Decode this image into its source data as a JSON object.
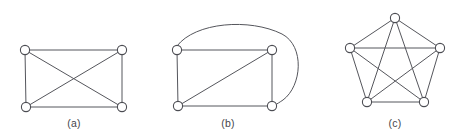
{
  "figure": {
    "background_color": "#ffffff",
    "edge_color": "#55565c",
    "node_fill_color": "#ffffff",
    "node_stroke_color": "#4c4d53",
    "caption_color": "#45464b",
    "node_radius": 4.6,
    "panels": [
      {
        "id": "panel-a",
        "caption": "(a)",
        "caption_position": {
          "x": 74,
          "y": 127
        },
        "graph_type": "K4 with one crossing",
        "vertex_count": 4,
        "edge_count": 6,
        "nodes": [
          {
            "id": "a1",
            "label": "top-left",
            "x": 25,
            "y": 50
          },
          {
            "id": "a2",
            "label": "top-right",
            "x": 122,
            "y": 50
          },
          {
            "id": "a3",
            "label": "bottom-left",
            "x": 26,
            "y": 107
          },
          {
            "id": "a4",
            "label": "bottom-right",
            "x": 122,
            "y": 107
          }
        ],
        "edges": [
          {
            "from": "a1",
            "to": "a2",
            "curved": false
          },
          {
            "from": "a1",
            "to": "a3",
            "curved": false
          },
          {
            "from": "a2",
            "to": "a4",
            "curved": false
          },
          {
            "from": "a3",
            "to": "a4",
            "curved": false
          },
          {
            "from": "a1",
            "to": "a4",
            "curved": false
          },
          {
            "from": "a2",
            "to": "a3",
            "curved": false
          }
        ]
      },
      {
        "id": "panel-b",
        "caption": "(b)",
        "caption_position": {
          "x": 228,
          "y": 127
        },
        "graph_type": "K4 drawn planar (one curved edge)",
        "vertex_count": 4,
        "edge_count": 6,
        "nodes": [
          {
            "id": "b1",
            "label": "top-left",
            "x": 177,
            "y": 50
          },
          {
            "id": "b2",
            "label": "top-right",
            "x": 272,
            "y": 50
          },
          {
            "id": "b3",
            "label": "bottom-left",
            "x": 178,
            "y": 106
          },
          {
            "id": "b4",
            "label": "bottom-right",
            "x": 272,
            "y": 106
          }
        ],
        "edges": [
          {
            "from": "b1",
            "to": "b2",
            "curved": false
          },
          {
            "from": "b1",
            "to": "b3",
            "curved": false
          },
          {
            "from": "b2",
            "to": "b4",
            "curved": false
          },
          {
            "from": "b3",
            "to": "b4",
            "curved": false
          },
          {
            "from": "b3",
            "to": "b2",
            "curved": false
          },
          {
            "from": "b1",
            "to": "b4",
            "curved": true,
            "path": "M 177 46 C 195 22, 250 18, 282 34 C 305 46, 302 86, 283 100 C 280 102, 277 104, 275 105"
          }
        ]
      },
      {
        "id": "panel-c",
        "caption": "(c)",
        "caption_position": {
          "x": 395,
          "y": 127
        },
        "graph_type": "K5 complete graph",
        "vertex_count": 5,
        "edge_count": 10,
        "nodes": [
          {
            "id": "c1",
            "label": "top",
            "x": 395,
            "y": 18
          },
          {
            "id": "c2",
            "label": "right",
            "x": 440,
            "y": 48
          },
          {
            "id": "c3",
            "label": "bottom-right",
            "x": 424,
            "y": 102
          },
          {
            "id": "c4",
            "label": "bottom-left",
            "x": 367,
            "y": 102
          },
          {
            "id": "c5",
            "label": "left",
            "x": 350,
            "y": 48
          }
        ],
        "edges": [
          {
            "from": "c1",
            "to": "c2",
            "curved": false
          },
          {
            "from": "c2",
            "to": "c3",
            "curved": false
          },
          {
            "from": "c3",
            "to": "c4",
            "curved": false
          },
          {
            "from": "c4",
            "to": "c5",
            "curved": false
          },
          {
            "from": "c5",
            "to": "c1",
            "curved": false
          },
          {
            "from": "c1",
            "to": "c3",
            "curved": false
          },
          {
            "from": "c1",
            "to": "c4",
            "curved": false
          },
          {
            "from": "c2",
            "to": "c4",
            "curved": false
          },
          {
            "from": "c2",
            "to": "c5",
            "curved": false
          },
          {
            "from": "c3",
            "to": "c5",
            "curved": false
          }
        ]
      }
    ]
  }
}
